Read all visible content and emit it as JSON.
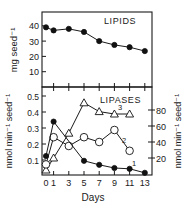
{
  "figure": {
    "top_panel_label": "LIPIDS",
    "bottom_panel_label": "LIPASES",
    "xlabel": "Days",
    "top_ylabel": "mg seed⁻¹",
    "bottom_left_ylabel": "nmol min⁻¹ seed⁻¹",
    "bottom_right_ylabel": "nmol min⁻¹ seed⁻¹"
  },
  "chart_data": [
    {
      "type": "line",
      "title": "LIPIDS",
      "xlabel": "Days",
      "ylabel": "mg seed⁻¹",
      "x": [
        0,
        1,
        3,
        5,
        7,
        9,
        11,
        13
      ],
      "series": [
        {
          "name": "Lipids",
          "marker": "filled-circle",
          "values": [
            39,
            37,
            38,
            36,
            30,
            27.5,
            26,
            23.5
          ]
        }
      ],
      "yticks": [
        10,
        20,
        30,
        40
      ],
      "ylim": [
        0,
        47
      ],
      "grid": false
    },
    {
      "type": "line",
      "title": "LIPASES",
      "xlabel": "Days",
      "xticks": [
        0,
        1,
        3,
        5,
        7,
        9,
        11,
        13
      ],
      "left_ylabel": "nmol min⁻¹ seed⁻¹",
      "right_ylabel": "nmol min⁻¹ seed⁻¹",
      "left_yticks": [
        0.1,
        0.2,
        0.3,
        0.4,
        0.5
      ],
      "right_yticks": [
        20,
        40,
        60,
        80
      ],
      "left_ylim": [
        0,
        0.5
      ],
      "right_ylim": [
        0,
        100
      ],
      "grid": false,
      "series": [
        {
          "name": "1",
          "marker": "filled-circle",
          "axis": "left",
          "x": [
            0,
            1,
            5,
            7,
            9,
            11,
            13
          ],
          "values": [
            0.125,
            0.34,
            0.095,
            0.07,
            0.05,
            0.045,
            0.02
          ]
        },
        {
          "name": "2",
          "marker": "open-circle",
          "axis": "right",
          "x": [
            0,
            1,
            3,
            5,
            7,
            9,
            11
          ],
          "values": [
            12,
            46,
            35,
            46,
            40,
            55,
            29
          ]
        },
        {
          "name": "3",
          "marker": "open-triangle",
          "axis": "right",
          "x": [
            0,
            1,
            3,
            5,
            7,
            9,
            11
          ],
          "values": [
            5,
            20,
            51,
            89,
            78,
            75,
            75
          ]
        }
      ]
    }
  ]
}
